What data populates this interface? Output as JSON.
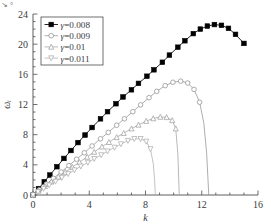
{
  "figure": {
    "corner_artifact": "↘ °",
    "background_color": "#ffffff",
    "axis_color": "#4c4c4c",
    "text_color": "#3a3a3a"
  },
  "chart_data": {
    "type": "line",
    "title": "",
    "xlabel": "k",
    "ylabel": "ωᵢ",
    "xlim": [
      0,
      16
    ],
    "ylim": [
      0,
      24
    ],
    "xticks": [
      0,
      4,
      8,
      12,
      16
    ],
    "yticks": [
      0,
      4,
      8,
      12,
      16,
      20,
      24
    ],
    "xminor_step": 1,
    "yminor_step": 1,
    "grid": false,
    "legend_position": "upper-left",
    "series": [
      {
        "name": "γ=0.008",
        "label": "γ=0.008",
        "marker": "filled-square",
        "color": "#000000",
        "x": [
          0,
          0.4,
          0.8,
          1.2,
          1.7,
          2.2,
          2.7,
          3.2,
          3.7,
          4.2,
          4.8,
          5.3,
          5.9,
          6.4,
          7.0,
          7.5,
          8.1,
          8.6,
          9.2,
          9.7,
          10.3,
          10.8,
          11.4,
          11.9,
          12.4,
          12.9,
          13.4,
          13.9,
          14.4,
          15.0
        ],
        "y": [
          0,
          0.85,
          1.75,
          2.65,
          3.75,
          4.85,
          5.9,
          6.95,
          7.95,
          8.95,
          10.1,
          11.05,
          12.1,
          13.0,
          13.95,
          14.8,
          15.75,
          16.6,
          17.6,
          18.55,
          19.6,
          20.45,
          21.4,
          22.0,
          22.4,
          22.6,
          22.5,
          22.1,
          21.3,
          20.1
        ]
      },
      {
        "name": "γ=0.009",
        "label": "γ=0.009",
        "marker": "open-circle",
        "color": "#8a8a8a",
        "x": [
          0,
          0.45,
          0.95,
          1.45,
          2.0,
          2.55,
          3.1,
          3.65,
          4.2,
          4.8,
          5.35,
          5.95,
          6.5,
          7.1,
          7.65,
          8.25,
          8.8,
          9.4,
          9.95,
          10.5,
          11.0,
          11.45,
          11.85,
          12.15,
          12.35,
          12.5
        ],
        "y": [
          0,
          0.7,
          1.45,
          2.2,
          3.05,
          3.9,
          4.75,
          5.6,
          6.5,
          7.45,
          8.3,
          9.25,
          10.1,
          11.05,
          11.95,
          12.9,
          13.75,
          14.5,
          14.95,
          15.1,
          14.85,
          14.0,
          12.3,
          9.5,
          5.5,
          0
        ]
      },
      {
        "name": "γ=0.01",
        "label": "γ=0.01",
        "marker": "open-triangle-up",
        "color": "#9a9a9a",
        "x": [
          0,
          0.4,
          0.85,
          1.3,
          1.8,
          2.3,
          2.8,
          3.3,
          3.85,
          4.35,
          4.9,
          5.4,
          5.95,
          6.45,
          7.0,
          7.5,
          8.05,
          8.55,
          9.05,
          9.5,
          9.9,
          10.15,
          10.3,
          10.4
        ],
        "y": [
          0,
          0.55,
          1.15,
          1.75,
          2.4,
          3.05,
          3.7,
          4.35,
          5.05,
          5.7,
          6.4,
          7.0,
          7.65,
          8.2,
          8.8,
          9.3,
          9.8,
          10.15,
          10.35,
          10.3,
          9.9,
          8.8,
          5.5,
          0
        ]
      },
      {
        "name": "γ=0.011",
        "label": "γ=0.011",
        "marker": "open-triangle-down",
        "color": "#a8a8a8",
        "x": [
          0,
          0.35,
          0.75,
          1.15,
          1.6,
          2.05,
          2.5,
          2.95,
          3.4,
          3.9,
          4.35,
          4.85,
          5.3,
          5.8,
          6.25,
          6.75,
          7.2,
          7.65,
          8.05,
          8.35,
          8.55,
          8.65,
          8.7
        ],
        "y": [
          0,
          0.4,
          0.85,
          1.3,
          1.8,
          2.3,
          2.8,
          3.3,
          3.8,
          4.3,
          4.8,
          5.3,
          5.8,
          6.3,
          6.75,
          7.2,
          7.45,
          7.45,
          7.1,
          6.1,
          4.2,
          2.0,
          0
        ]
      }
    ]
  }
}
